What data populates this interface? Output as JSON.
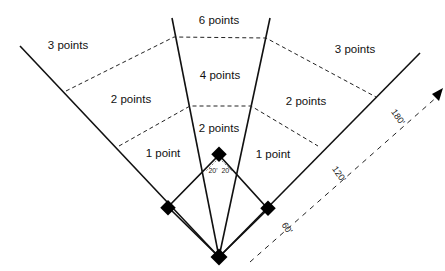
{
  "zones": {
    "center_far": "6 points",
    "left_far": "3 points",
    "right_far": "3 points",
    "center_mid": "4 points",
    "left_mid": "2 points",
    "right_mid": "2 points",
    "center_near": "2 points",
    "left_near": "1 point",
    "right_near": "1 point"
  },
  "angle_labels": {
    "left": "20'",
    "right": "20'"
  },
  "distance_labels": {
    "d60": "60'",
    "d120": "120'",
    "d180": "180'"
  }
}
